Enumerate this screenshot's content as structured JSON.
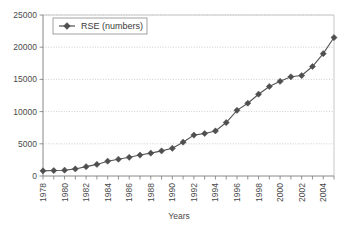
{
  "chart_data": {
    "type": "line",
    "title": "",
    "xlabel": "Years",
    "ylabel": "",
    "legend": [
      "RSE (numbers)"
    ],
    "legend_position": "top-left-inside",
    "grid": true,
    "ylim": [
      0,
      25000
    ],
    "ytick_labels": [
      "0",
      "5000",
      "10000",
      "15000",
      "20000",
      "25000"
    ],
    "ytick_values": [
      0,
      5000,
      10000,
      15000,
      20000,
      25000
    ],
    "xlim": [
      1978,
      2005
    ],
    "xtick_labels": [
      "1978",
      "1980",
      "1982",
      "1984",
      "1986",
      "1988",
      "1990",
      "1992",
      "1994",
      "1996",
      "1998",
      "2000",
      "2002",
      "2004"
    ],
    "x": [
      1978,
      1979,
      1980,
      1981,
      1982,
      1983,
      1984,
      1985,
      1986,
      1987,
      1988,
      1989,
      1990,
      1991,
      1992,
      1993,
      1994,
      1995,
      1996,
      1997,
      1998,
      1999,
      2000,
      2001,
      2002,
      2003,
      2004,
      2005
    ],
    "series": [
      {
        "name": "RSE (numbers)",
        "marker": "diamond",
        "color": "#4f4f4f",
        "values": [
          800,
          850,
          900,
          1100,
          1450,
          1800,
          2300,
          2600,
          2900,
          3250,
          3550,
          3900,
          4300,
          5250,
          6350,
          6600,
          7000,
          8300,
          10200,
          11300,
          12700,
          13900,
          14700,
          15400,
          15600,
          17000,
          19000,
          21500
        ]
      }
    ]
  },
  "axis": {
    "x_title": "Years"
  },
  "legend": {
    "entry_label": "RSE (numbers)"
  }
}
